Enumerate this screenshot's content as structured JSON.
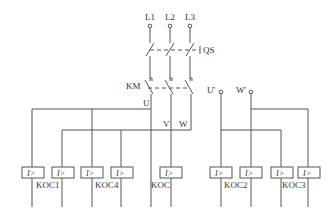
{
  "diagram": {
    "type": "electrical-schematic",
    "supply_terminals": [
      "L1",
      "L2",
      "L3"
    ],
    "switches": {
      "isolator": "QS",
      "contactor": "KM"
    },
    "bus_labels": {
      "u": "U",
      "v": "V",
      "w": "W",
      "u_prime": "U'",
      "w_prime": "W'"
    },
    "relay_symbol": "I>",
    "relay_labels": {
      "koc1": "KOC1",
      "koc4": "KOC4",
      "koc": "KOC",
      "koc2": "KOC2",
      "koc3": "KOC3"
    }
  }
}
